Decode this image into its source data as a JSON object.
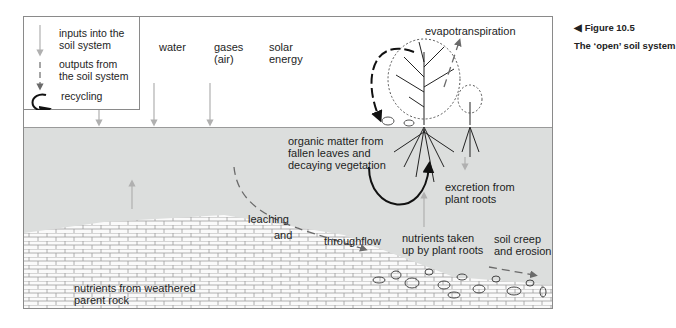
{
  "figure": {
    "number_label": "◀ Figure 10.5",
    "title": "The ‘open’ soil system"
  },
  "legend": {
    "items": [
      {
        "icon": "gray-arrow-down-icon",
        "label": "inputs into the\nsoil system"
      },
      {
        "icon": "dashed-arrow-icon",
        "label": "outputs from\nthe soil system"
      },
      {
        "icon": "recycling-loop-icon",
        "label": "recycling"
      }
    ]
  },
  "inputs": {
    "water": "water",
    "gases": "gases\n(air)",
    "solar": "solar\nenergy"
  },
  "labels": {
    "evapotranspiration": "evapotranspiration",
    "organic_matter": "organic matter from\nfallen leaves and\ndecaying vegetation",
    "excretion": "excretion from\nplant roots",
    "leaching": "leaching",
    "and": "and",
    "throughflow": "throughflow",
    "nutrients_taken_up": "nutrients taken\nup by plant roots",
    "soil_creep": "soil creep\nand erosion",
    "parent_rock": "nutrients from weathered\nparent rock"
  },
  "colors": {
    "soil": "#dcdedd",
    "input_arrow": "#b0b0b0",
    "output_arrow": "#7a7a7a",
    "recycle_arrow": "#111111"
  }
}
